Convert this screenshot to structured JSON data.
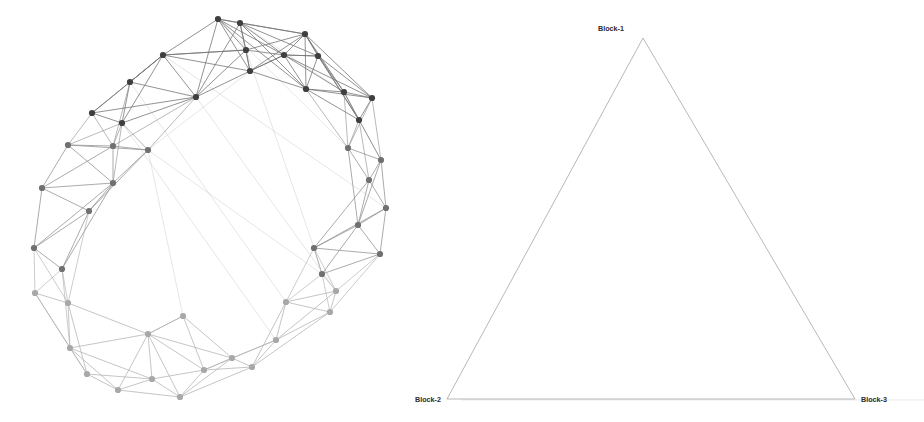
{
  "figure": {
    "width": 924,
    "height": 422,
    "background": "#ffffff",
    "panels": [
      {
        "name": "graph-panel",
        "kind": "network-graph"
      },
      {
        "name": "simplex-panel",
        "kind": "triangle-simplex"
      }
    ]
  },
  "simplex": {
    "edge_color": "#9a9a9a",
    "edge_width": 0.7,
    "vertices": [
      {
        "id": "block-1",
        "label": "Block-1",
        "x": 643,
        "y": 38,
        "label_x": 624,
        "label_y": 31,
        "label_anchor": "end"
      },
      {
        "id": "block-2",
        "label": "Block-2",
        "x": 447,
        "y": 399,
        "label_x": 441,
        "label_y": 402,
        "label_anchor": "end"
      },
      {
        "id": "block-3",
        "label": "Block-3",
        "x": 855,
        "y": 399,
        "label_x": 861,
        "label_y": 402,
        "label_anchor": "start"
      }
    ],
    "baseline": {
      "x1": 462,
      "x2": 924,
      "y": 400
    },
    "label_font_size": "7.2px",
    "label_color": "#2b2b2b"
  },
  "chart_data": {
    "type": "scatter",
    "title": "",
    "xlabel": "",
    "ylabel": "",
    "legend_position": "none",
    "grid": false,
    "blocks": [
      {
        "id": "block-1",
        "label": "Block-1",
        "color": "#3f3f3f",
        "count": 16
      },
      {
        "id": "block-2",
        "label": "Block-2",
        "color": "#707070",
        "count": 16
      },
      {
        "id": "block-3",
        "label": "Block-3",
        "color": "#a8a8a8",
        "count": 16
      }
    ],
    "node_radius": 3.1,
    "edge_color_light": "#c9c9c9",
    "edge_color_dark": "#6e6e6e",
    "nodes": [
      {
        "i": 0,
        "x": 218,
        "y": 19,
        "block": 0
      },
      {
        "i": 1,
        "x": 240,
        "y": 23,
        "block": 0
      },
      {
        "i": 2,
        "x": 246,
        "y": 50,
        "block": 0
      },
      {
        "i": 3,
        "x": 305,
        "y": 34,
        "block": 0
      },
      {
        "i": 4,
        "x": 163,
        "y": 55,
        "block": 0
      },
      {
        "i": 5,
        "x": 284,
        "y": 55,
        "block": 0
      },
      {
        "i": 6,
        "x": 318,
        "y": 56,
        "block": 0
      },
      {
        "i": 7,
        "x": 250,
        "y": 71,
        "block": 0
      },
      {
        "i": 8,
        "x": 130,
        "y": 82,
        "block": 0
      },
      {
        "i": 9,
        "x": 306,
        "y": 89,
        "block": 0
      },
      {
        "i": 10,
        "x": 344,
        "y": 92,
        "block": 0
      },
      {
        "i": 11,
        "x": 196,
        "y": 97,
        "block": 0
      },
      {
        "i": 12,
        "x": 372,
        "y": 98,
        "block": 0
      },
      {
        "i": 13,
        "x": 92,
        "y": 113,
        "block": 0
      },
      {
        "i": 14,
        "x": 122,
        "y": 123,
        "block": 0
      },
      {
        "i": 15,
        "x": 359,
        "y": 120,
        "block": 0
      },
      {
        "i": 16,
        "x": 68,
        "y": 145,
        "block": 1
      },
      {
        "i": 17,
        "x": 113,
        "y": 146,
        "block": 1
      },
      {
        "i": 18,
        "x": 348,
        "y": 148,
        "block": 1
      },
      {
        "i": 19,
        "x": 381,
        "y": 160,
        "block": 1
      },
      {
        "i": 20,
        "x": 148,
        "y": 150,
        "block": 1
      },
      {
        "i": 21,
        "x": 369,
        "y": 180,
        "block": 1
      },
      {
        "i": 22,
        "x": 42,
        "y": 188,
        "block": 1
      },
      {
        "i": 23,
        "x": 113,
        "y": 183,
        "block": 1
      },
      {
        "i": 24,
        "x": 386,
        "y": 208,
        "block": 1
      },
      {
        "i": 25,
        "x": 358,
        "y": 225,
        "block": 1
      },
      {
        "i": 26,
        "x": 89,
        "y": 211,
        "block": 1
      },
      {
        "i": 27,
        "x": 34,
        "y": 248,
        "block": 1
      },
      {
        "i": 28,
        "x": 314,
        "y": 248,
        "block": 1
      },
      {
        "i": 29,
        "x": 380,
        "y": 254,
        "block": 1
      },
      {
        "i": 30,
        "x": 62,
        "y": 269,
        "block": 1
      },
      {
        "i": 31,
        "x": 322,
        "y": 274,
        "block": 1
      },
      {
        "i": 32,
        "x": 35,
        "y": 293,
        "block": 2
      },
      {
        "i": 33,
        "x": 336,
        "y": 291,
        "block": 2
      },
      {
        "i": 34,
        "x": 68,
        "y": 303,
        "block": 2
      },
      {
        "i": 35,
        "x": 286,
        "y": 302,
        "block": 2
      },
      {
        "i": 36,
        "x": 148,
        "y": 334,
        "block": 2
      },
      {
        "i": 37,
        "x": 70,
        "y": 348,
        "block": 2
      },
      {
        "i": 38,
        "x": 330,
        "y": 312,
        "block": 2
      },
      {
        "i": 39,
        "x": 183,
        "y": 316,
        "block": 2
      },
      {
        "i": 40,
        "x": 276,
        "y": 340,
        "block": 2
      },
      {
        "i": 41,
        "x": 232,
        "y": 358,
        "block": 2
      },
      {
        "i": 42,
        "x": 87,
        "y": 374,
        "block": 2
      },
      {
        "i": 43,
        "x": 152,
        "y": 379,
        "block": 2
      },
      {
        "i": 44,
        "x": 204,
        "y": 370,
        "block": 2
      },
      {
        "i": 45,
        "x": 252,
        "y": 367,
        "block": 2
      },
      {
        "i": 46,
        "x": 118,
        "y": 390,
        "block": 2
      },
      {
        "i": 47,
        "x": 180,
        "y": 397,
        "block": 2
      }
    ],
    "edges": [
      [
        0,
        1
      ],
      [
        0,
        2
      ],
      [
        0,
        4
      ],
      [
        0,
        7
      ],
      [
        0,
        11
      ],
      [
        0,
        5
      ],
      [
        0,
        3
      ],
      [
        0,
        9
      ],
      [
        1,
        2
      ],
      [
        1,
        3
      ],
      [
        1,
        5
      ],
      [
        1,
        7
      ],
      [
        1,
        9
      ],
      [
        1,
        11
      ],
      [
        1,
        6
      ],
      [
        1,
        10
      ],
      [
        2,
        4
      ],
      [
        2,
        5
      ],
      [
        2,
        7
      ],
      [
        2,
        11
      ],
      [
        2,
        3
      ],
      [
        3,
        5
      ],
      [
        3,
        6
      ],
      [
        3,
        9
      ],
      [
        3,
        10
      ],
      [
        3,
        12
      ],
      [
        3,
        7
      ],
      [
        3,
        15
      ],
      [
        4,
        8
      ],
      [
        4,
        11
      ],
      [
        4,
        2
      ],
      [
        4,
        7
      ],
      [
        4,
        14
      ],
      [
        4,
        13
      ],
      [
        5,
        6
      ],
      [
        5,
        7
      ],
      [
        5,
        9
      ],
      [
        5,
        10
      ],
      [
        5,
        12
      ],
      [
        6,
        9
      ],
      [
        6,
        10
      ],
      [
        6,
        12
      ],
      [
        6,
        15
      ],
      [
        6,
        5
      ],
      [
        7,
        11
      ],
      [
        7,
        9
      ],
      [
        7,
        5
      ],
      [
        7,
        20
      ],
      [
        8,
        13
      ],
      [
        8,
        14
      ],
      [
        8,
        11
      ],
      [
        8,
        4
      ],
      [
        8,
        17
      ],
      [
        9,
        10
      ],
      [
        9,
        12
      ],
      [
        9,
        15
      ],
      [
        9,
        18
      ],
      [
        10,
        12
      ],
      [
        10,
        15
      ],
      [
        10,
        18
      ],
      [
        10,
        19
      ],
      [
        11,
        14
      ],
      [
        11,
        20
      ],
      [
        11,
        17
      ],
      [
        11,
        13
      ],
      [
        12,
        15
      ],
      [
        12,
        18
      ],
      [
        12,
        19
      ],
      [
        13,
        14
      ],
      [
        13,
        17
      ],
      [
        13,
        16
      ],
      [
        14,
        17
      ],
      [
        14,
        20
      ],
      [
        14,
        16
      ],
      [
        14,
        23
      ],
      [
        15,
        18
      ],
      [
        15,
        19
      ],
      [
        15,
        21
      ],
      [
        16,
        17
      ],
      [
        16,
        22
      ],
      [
        16,
        23
      ],
      [
        16,
        20
      ],
      [
        17,
        20
      ],
      [
        17,
        23
      ],
      [
        17,
        22
      ],
      [
        18,
        19
      ],
      [
        18,
        21
      ],
      [
        18,
        25
      ],
      [
        19,
        21
      ],
      [
        19,
        24
      ],
      [
        19,
        25
      ],
      [
        20,
        23
      ],
      [
        20,
        26
      ],
      [
        20,
        39
      ],
      [
        21,
        24
      ],
      [
        21,
        25
      ],
      [
        21,
        28
      ],
      [
        22,
        23
      ],
      [
        22,
        26
      ],
      [
        22,
        27
      ],
      [
        23,
        26
      ],
      [
        23,
        27
      ],
      [
        23,
        30
      ],
      [
        24,
        25
      ],
      [
        24,
        29
      ],
      [
        24,
        28
      ],
      [
        25,
        28
      ],
      [
        25,
        29
      ],
      [
        25,
        31
      ],
      [
        26,
        27
      ],
      [
        26,
        30
      ],
      [
        26,
        34
      ],
      [
        27,
        30
      ],
      [
        27,
        32
      ],
      [
        27,
        34
      ],
      [
        28,
        29
      ],
      [
        28,
        31
      ],
      [
        28,
        33
      ],
      [
        28,
        35
      ],
      [
        29,
        31
      ],
      [
        29,
        33
      ],
      [
        29,
        38
      ],
      [
        30,
        32
      ],
      [
        30,
        34
      ],
      [
        30,
        37
      ],
      [
        31,
        33
      ],
      [
        31,
        35
      ],
      [
        31,
        38
      ],
      [
        32,
        34
      ],
      [
        32,
        37
      ],
      [
        32,
        42
      ],
      [
        33,
        35
      ],
      [
        33,
        38
      ],
      [
        33,
        40
      ],
      [
        34,
        37
      ],
      [
        34,
        42
      ],
      [
        34,
        36
      ],
      [
        35,
        38
      ],
      [
        35,
        40
      ],
      [
        35,
        45
      ],
      [
        36,
        39
      ],
      [
        36,
        41
      ],
      [
        36,
        43
      ],
      [
        36,
        44
      ],
      [
        36,
        37
      ],
      [
        36,
        46
      ],
      [
        36,
        47
      ],
      [
        37,
        42
      ],
      [
        37,
        43
      ],
      [
        37,
        46
      ],
      [
        38,
        40
      ],
      [
        38,
        45
      ],
      [
        39,
        41
      ],
      [
        39,
        44
      ],
      [
        39,
        36
      ],
      [
        40,
        45
      ],
      [
        40,
        41
      ],
      [
        40,
        44
      ],
      [
        41,
        44
      ],
      [
        41,
        45
      ],
      [
        41,
        47
      ],
      [
        42,
        43
      ],
      [
        42,
        46
      ],
      [
        43,
        46
      ],
      [
        43,
        47
      ],
      [
        43,
        44
      ],
      [
        44,
        45
      ],
      [
        44,
        47
      ],
      [
        45,
        47
      ],
      [
        46,
        47
      ],
      [
        11,
        33
      ],
      [
        2,
        28
      ],
      [
        14,
        40
      ],
      [
        20,
        31
      ],
      [
        4,
        24
      ],
      [
        8,
        35
      ],
      [
        0,
        18
      ]
    ]
  }
}
